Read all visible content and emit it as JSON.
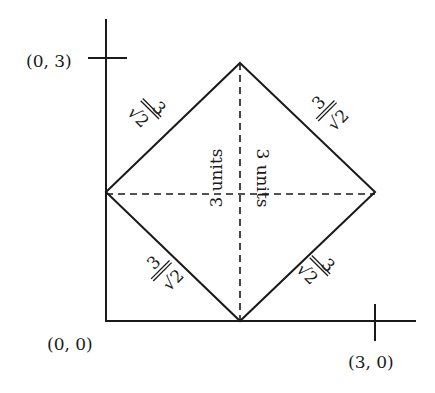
{
  "labels": {
    "origin": "(0, 0)",
    "y_tick": "(0, 3)",
    "x_tick": "(3, 0)",
    "diag_vertical": "3 units",
    "diag_horizontal": "3 units",
    "side_numerator": "3",
    "side_denominator": "√2"
  },
  "colors": {
    "line": "#1a1a1a",
    "background": "#ffffff"
  }
}
